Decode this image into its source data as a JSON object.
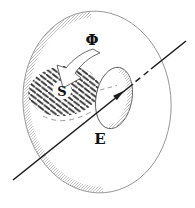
{
  "diagram": {
    "labels": {
      "flux": "Φ",
      "surface": "S",
      "field": "E"
    },
    "colors": {
      "background": "#ffffff",
      "ink": "#1c1c1c",
      "label": "#111111",
      "disk_outline": "#8f8f8f",
      "loop_outline": "#555555",
      "rim_stipple": "#b3b3b3",
      "hatch": "#262626",
      "hidden_edge": "#9a9a9a",
      "arrow_outline": "#5a5a5a",
      "arrow_fill": "#ffffff"
    }
  }
}
